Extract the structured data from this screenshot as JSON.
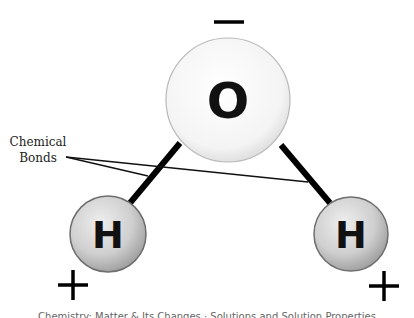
{
  "diagram": {
    "atoms": [
      {
        "id": "oxygen",
        "symbol": "O",
        "cx": 228,
        "cy": 100,
        "r": 62,
        "fill": "#f7f7f7"
      },
      {
        "id": "hydrogen-left",
        "symbol": "H",
        "cx": 108,
        "cy": 234,
        "r": 38,
        "fill": "#d2d2d2"
      },
      {
        "id": "hydrogen-right",
        "symbol": "H",
        "cx": 351,
        "cy": 234,
        "r": 37,
        "fill": "#d2d2d2"
      }
    ],
    "bonds": [
      {
        "id": "bond-left",
        "x1": 180,
        "y1": 143,
        "x2": 130,
        "y2": 203
      },
      {
        "id": "bond-right",
        "x1": 281,
        "y1": 145,
        "x2": 330,
        "y2": 203
      }
    ],
    "charges": {
      "oxygen": "−",
      "hydrogen_left": "+",
      "hydrogen_right": "+"
    },
    "label": {
      "line1": "Chemical",
      "line2": "Bonds"
    },
    "pointers": [
      {
        "x1": 66,
        "y1": 157,
        "x2": 148,
        "y2": 176
      },
      {
        "x1": 66,
        "y1": 157,
        "x2": 308,
        "y2": 182
      }
    ],
    "footer_caption": "Chemistry: Matter & Its Changes · Solutions and Solution Properties"
  }
}
